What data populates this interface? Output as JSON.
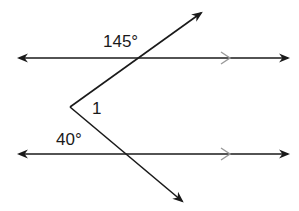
{
  "diagram": {
    "type": "parallel-lines-transversal",
    "labels": {
      "angle_top": "145°",
      "angle_bottom": "40°",
      "angle_unknown": "1"
    },
    "colors": {
      "line": "#1a1a1a",
      "parallel_marker": "#9a9a9a",
      "background": "#ffffff"
    },
    "lines": [
      {
        "name": "top-parallel-line",
        "y": 58,
        "x1": 17,
        "x2": 290,
        "parallel_marker_x": 228
      },
      {
        "name": "bottom-parallel-line",
        "y": 154,
        "x1": 17,
        "x2": 290,
        "parallel_marker_x": 228
      }
    ],
    "vertex": {
      "x": 70,
      "y": 107
    },
    "rays": [
      {
        "name": "upper-ray",
        "end_x": 202,
        "end_y": 12
      },
      {
        "name": "lower-ray",
        "end_x": 183,
        "end_y": 202
      }
    ]
  }
}
